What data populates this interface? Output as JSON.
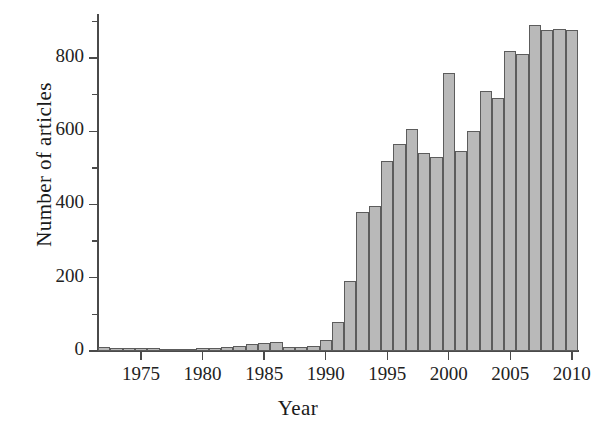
{
  "chart_data": {
    "type": "bar",
    "title": "",
    "xlabel": "Year",
    "ylabel": "Number of articles",
    "categories": [
      1972,
      1973,
      1974,
      1975,
      1976,
      1977,
      1978,
      1979,
      1980,
      1981,
      1982,
      1983,
      1984,
      1985,
      1986,
      1987,
      1988,
      1989,
      1990,
      1991,
      1992,
      1993,
      1994,
      1995,
      1996,
      1997,
      1998,
      1999,
      2000,
      2001,
      2002,
      2003,
      2004,
      2005,
      2006,
      2007,
      2008,
      2009,
      2010
    ],
    "values": [
      12,
      7,
      8,
      9,
      7,
      6,
      6,
      6,
      8,
      9,
      10,
      14,
      18,
      22,
      24,
      12,
      11,
      14,
      30,
      80,
      190,
      380,
      395,
      520,
      565,
      605,
      540,
      530,
      760,
      545,
      600,
      710,
      690,
      820,
      810,
      890,
      875,
      878,
      875
    ],
    "xlim": [
      1971.5,
      2010.5
    ],
    "ylim": [
      0,
      920
    ],
    "ytick_values": [
      0,
      200,
      400,
      600,
      800
    ],
    "ytick_labels": [
      "0",
      "200",
      "400",
      "600",
      "800"
    ],
    "yminor_values": [
      100,
      300,
      500,
      700,
      900
    ],
    "xtick_values": [
      1975,
      1980,
      1985,
      1990,
      1995,
      2000,
      2005,
      2010
    ],
    "xtick_labels": [
      "1975",
      "1980",
      "1985",
      "1990",
      "1995",
      "2000",
      "2005",
      "2010"
    ],
    "grid": false,
    "legend": null,
    "bar_fill_color": "#b9b9b9",
    "bar_edge_color": "#5c5c5c",
    "axis_color": "#4a4a4a",
    "text_color": "#1a1a1a"
  }
}
